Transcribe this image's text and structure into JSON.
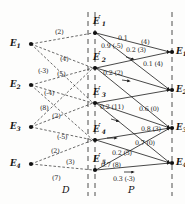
{
  "figure": {
    "regions": [
      {
        "id": "region-D",
        "label": "D",
        "x": 62,
        "y": 184
      },
      {
        "id": "region-P",
        "label": "P",
        "x": 128,
        "y": 184
      }
    ],
    "axes": [
      {
        "id": "axis-left",
        "x": 88
      },
      {
        "id": "axis-middle",
        "x": 95
      },
      {
        "id": "axis-right",
        "x": 172
      }
    ],
    "nodes": {
      "left": [
        {
          "id": "E1",
          "base": "E",
          "sub": "1",
          "prime": false,
          "x": 31,
          "y": 44,
          "lx": 10,
          "ly": 39
        },
        {
          "id": "E2",
          "base": "E",
          "sub": "2",
          "prime": false,
          "x": 31,
          "y": 85,
          "lx": 10,
          "ly": 80
        },
        {
          "id": "E3",
          "base": "E",
          "sub": "3",
          "prime": false,
          "x": 31,
          "y": 127,
          "lx": 10,
          "ly": 122
        },
        {
          "id": "E4",
          "base": "E",
          "sub": "4",
          "prime": false,
          "x": 31,
          "y": 164,
          "lx": 10,
          "ly": 159
        }
      ],
      "middle": [
        {
          "id": "Ep1",
          "base": "E",
          "sub": "1",
          "prime": true,
          "x": 95,
          "y": 33,
          "lx": 93,
          "ly": 17
        },
        {
          "id": "Ep2",
          "base": "E",
          "sub": "2",
          "prime": true,
          "x": 95,
          "y": 68,
          "lx": 93,
          "ly": 53
        },
        {
          "id": "Ep3",
          "base": "E",
          "sub": "3",
          "prime": true,
          "x": 95,
          "y": 103,
          "lx": 93,
          "ly": 88
        },
        {
          "id": "Ep4",
          "base": "E",
          "sub": "4",
          "prime": true,
          "x": 95,
          "y": 140,
          "lx": 93,
          "ly": 125
        },
        {
          "id": "Ep5",
          "base": "E",
          "sub": "5",
          "prime": true,
          "x": 95,
          "y": 170,
          "lx": 93,
          "ly": 155
        }
      ],
      "right": [
        {
          "id": "Er1",
          "base": "E",
          "sub": "1",
          "prime": false,
          "x": 172,
          "y": 52,
          "lx": 176,
          "ly": 47
        },
        {
          "id": "Er2",
          "base": "E",
          "sub": "2",
          "prime": false,
          "x": 172,
          "y": 90,
          "lx": 176,
          "ly": 85
        },
        {
          "id": "Er3",
          "base": "E",
          "sub": "3",
          "prime": false,
          "x": 172,
          "y": 128,
          "lx": 176,
          "ly": 123
        },
        {
          "id": "Er4",
          "base": "E",
          "sub": "4",
          "prime": false,
          "x": 172,
          "y": 163,
          "lx": 176,
          "ly": 158
        }
      ]
    },
    "left_edges": [
      {
        "id": "d-e1-ep1",
        "from": "E1",
        "to": "Ep1",
        "label": "(2)",
        "lx": 55,
        "ly": 29
      },
      {
        "id": "d-e1-ep2",
        "from": "E1",
        "to": "Ep2",
        "label": "(4)",
        "lx": 60,
        "ly": 56
      },
      {
        "id": "d-e1-ep3",
        "from": "E1",
        "to": "Ep3",
        "label": "(5)",
        "lx": 57,
        "ly": 71
      },
      {
        "id": "d-e2-ep2",
        "from": "E2",
        "to": "Ep2",
        "label": "(-3)",
        "lx": 38,
        "ly": 68
      },
      {
        "id": "d-e2-ep3",
        "from": "E2",
        "to": "Ep3",
        "label": "(-4)",
        "lx": 44,
        "ly": 90
      },
      {
        "id": "d-e3-ep2",
        "from": "E3",
        "to": "Ep2",
        "label": "(8)",
        "lx": 40,
        "ly": 105
      },
      {
        "id": "d-e3-ep3",
        "from": "E3",
        "to": "Ep3",
        "label": "(2)",
        "lx": 52,
        "ly": 113
      },
      {
        "id": "d-e3-ep4",
        "from": "E3",
        "to": "Ep4",
        "label": "(-5)",
        "lx": 57,
        "ly": 134
      },
      {
        "id": "d-e4-ep4",
        "from": "E4",
        "to": "Ep4",
        "label": "(2)",
        "lx": 51,
        "ly": 148
      },
      {
        "id": "d-e4-ep5",
        "from": "E4",
        "to": "Ep5",
        "label": "(3)",
        "lx": 66,
        "ly": 159
      },
      {
        "id": "d-e4-ep5b",
        "from": "E4",
        "to": "Ep5",
        "label": "(7)",
        "lx": 52,
        "ly": 175
      }
    ],
    "right_edges": [
      {
        "id": "p-ep1-er1",
        "from": "Ep1",
        "to": "Er1",
        "label": "0.1",
        "lx": 118,
        "ly": 35
      },
      {
        "id": "p-ep1-er1b",
        "from": "Ep1",
        "to": "Er1",
        "label": "(4)",
        "lx": 141,
        "ly": 39
      },
      {
        "id": "p-ep1-er2",
        "from": "Ep1",
        "to": "Er2",
        "label": "0.9 (-5)",
        "lx": 101,
        "ly": 43
      },
      {
        "id": "p-ep2-er1",
        "from": "Ep2",
        "to": "Er1",
        "label": "0.2 (3)",
        "lx": 126,
        "ly": 47
      },
      {
        "id": "p-ep2-er2",
        "from": "Ep2",
        "to": "Er2",
        "label": "0.1 (4)",
        "lx": 143,
        "ly": 61
      },
      {
        "id": "p-ep2-er2b",
        "from": "Ep2",
        "to": "Er2",
        "label": "0.2 (2)",
        "lx": 103,
        "ly": 70
      },
      {
        "id": "p-ep3-er2",
        "from": "Ep3",
        "to": "Er2",
        "label": "0.2 (11)",
        "lx": 100,
        "ly": 104
      },
      {
        "id": "p-ep3-er3",
        "from": "Ep3",
        "to": "Er3",
        "label": "0.6 (0)",
        "lx": 139,
        "ly": 106
      },
      {
        "id": "p-ep4-er3",
        "from": "Ep4",
        "to": "Er3",
        "label": "0.8 (3)",
        "lx": 141,
        "ly": 126
      },
      {
        "id": "p-ep4-er4",
        "from": "Ep4",
        "to": "Er4",
        "label": "0.7 (0)",
        "lx": 135,
        "ly": 140
      },
      {
        "id": "p-ep4-er4b",
        "from": "Ep4",
        "to": "Er4",
        "label": "0.2 (5)",
        "lx": 112,
        "ly": 150
      },
      {
        "id": "p-ep5-er4",
        "from": "Ep5",
        "to": "Er4",
        "label": "0.7 (8)",
        "lx": 101,
        "ly": 162
      },
      {
        "id": "p-ep5-er4b",
        "from": "Ep5",
        "to": "Er4",
        "label": "0.3 (-3)",
        "lx": 113,
        "ly": 176
      }
    ],
    "colors": {
      "ink": "#1a1a1a",
      "axis": "#3a3a3a",
      "background": "#fdfdfc"
    }
  }
}
